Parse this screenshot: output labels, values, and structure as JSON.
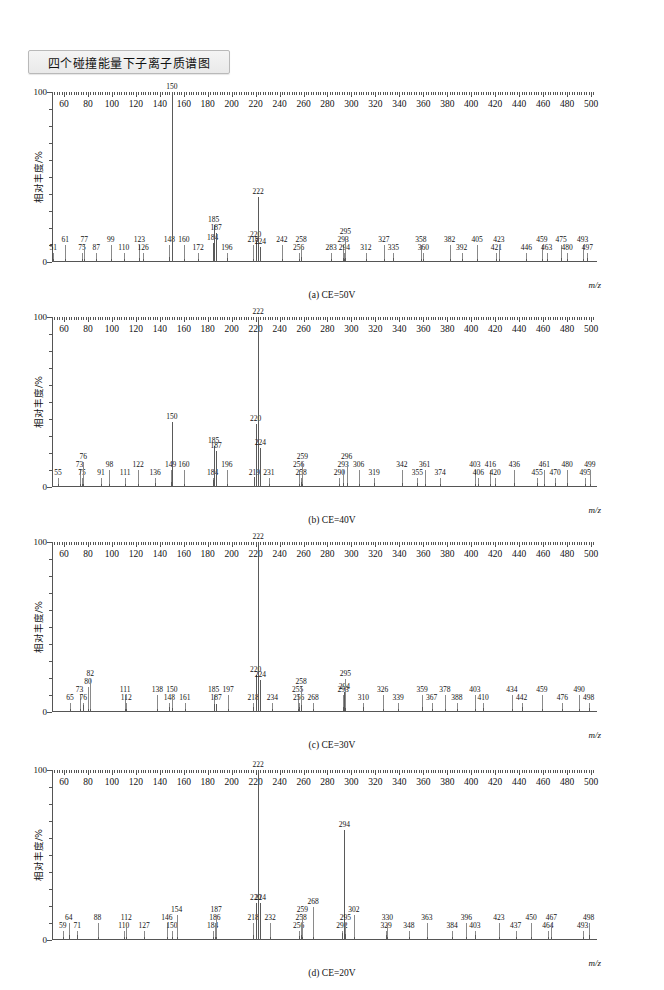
{
  "title": "四个碰撞能量下子离子质谱图",
  "axis": {
    "ylabel": "相对丰度/%",
    "xlabel": "m/z",
    "ytick_labels": [
      "0",
      "100"
    ],
    "xtick_labels": [
      "60",
      "80",
      "100",
      "120",
      "140",
      "160",
      "180",
      "200",
      "220",
      "240",
      "260",
      "280",
      "300",
      "320",
      "340",
      "360",
      "380",
      "400",
      "420",
      "440",
      "460",
      "480",
      "500"
    ],
    "xmin": 50,
    "xmax": 505,
    "ymin": 0,
    "ymax": 100
  },
  "chart_data": [
    {
      "type": "bar",
      "id": "a",
      "title": "(a) CE=50V",
      "xlabel": "m/z",
      "ylabel": "相对丰度/%",
      "xlim": [
        50,
        505
      ],
      "ylim": [
        0,
        100
      ],
      "grid": false,
      "legend": "none",
      "categories": [
        51,
        61,
        75,
        77,
        87,
        99,
        110,
        123,
        126,
        148,
        150,
        160,
        172,
        184,
        185,
        187,
        196,
        218,
        220,
        222,
        224,
        242,
        256,
        258,
        283,
        293,
        294,
        295,
        312,
        327,
        335,
        358,
        360,
        382,
        392,
        405,
        421,
        423,
        446,
        459,
        463,
        475,
        480,
        493,
        497
      ],
      "values": [
        2,
        2,
        2,
        2,
        2,
        2,
        2,
        2.5,
        2,
        3,
        100,
        2,
        2,
        11,
        22,
        17,
        2.5,
        2,
        13,
        38,
        9,
        2,
        2,
        3,
        2,
        2.5,
        2,
        2.5,
        2,
        2,
        2.5,
        2,
        2,
        2,
        2,
        2,
        2,
        2,
        2,
        2,
        2,
        2.5,
        2,
        2,
        2.5
      ]
    },
    {
      "type": "bar",
      "id": "b",
      "title": "(b) CE=40V",
      "xlabel": "m/z",
      "ylabel": "相对丰度/%",
      "xlim": [
        50,
        505
      ],
      "ylim": [
        0,
        100
      ],
      "grid": false,
      "legend": "none",
      "categories": [
        55,
        73,
        75,
        76,
        91,
        98,
        111,
        122,
        136,
        149,
        150,
        160,
        184,
        185,
        187,
        196,
        219,
        220,
        222,
        224,
        231,
        256,
        258,
        259,
        290,
        293,
        296,
        306,
        319,
        342,
        355,
        361,
        374,
        403,
        406,
        416,
        420,
        436,
        455,
        461,
        470,
        480,
        495,
        499
      ],
      "values": [
        2,
        2,
        2,
        2,
        2,
        2,
        2,
        2,
        2.5,
        3,
        38,
        2,
        4,
        24,
        21,
        2,
        6,
        37,
        100,
        23,
        2,
        2,
        3,
        2,
        2,
        2.5,
        2.5,
        2,
        2.5,
        2.5,
        2.5,
        2,
        2,
        2,
        2,
        2,
        2,
        2.5,
        2.5,
        2,
        2.5,
        2.5,
        2,
        2
      ]
    },
    {
      "type": "bar",
      "id": "c",
      "title": "(c) CE=30V",
      "xlabel": "m/z",
      "ylabel": "相对丰度/%",
      "xlim": [
        50,
        505
      ],
      "ylim": [
        0,
        100
      ],
      "grid": false,
      "legend": "none",
      "categories": [
        65,
        73,
        76,
        80,
        82,
        111,
        112,
        138,
        148,
        150,
        161,
        185,
        187,
        197,
        218,
        220,
        222,
        224,
        234,
        255,
        256,
        258,
        268,
        293,
        294,
        295,
        310,
        326,
        339,
        359,
        367,
        378,
        388,
        403,
        410,
        434,
        442,
        459,
        476,
        490,
        498
      ],
      "values": [
        2,
        2,
        4,
        2,
        2,
        2,
        2,
        2,
        3,
        2.5,
        2,
        5,
        4.5,
        2,
        3,
        22,
        100,
        19,
        2,
        2,
        3,
        4,
        2,
        3,
        12,
        2.5,
        3,
        2,
        2,
        3,
        2,
        2,
        2,
        2,
        2.5,
        2,
        3,
        2,
        2,
        2,
        2.5
      ]
    },
    {
      "type": "bar",
      "id": "d",
      "title": "(d) CE=20V",
      "xlabel": "m/z",
      "ylabel": "相对丰度/%",
      "xlim": [
        50,
        505
      ],
      "ylim": [
        0,
        100
      ],
      "grid": false,
      "legend": "none",
      "categories": [
        59,
        64,
        71,
        88,
        110,
        112,
        127,
        146,
        150,
        154,
        184,
        186,
        187,
        218,
        220,
        222,
        224,
        232,
        256,
        258,
        259,
        268,
        292,
        294,
        295,
        302,
        329,
        330,
        348,
        363,
        384,
        396,
        403,
        423,
        437,
        450,
        464,
        467,
        493,
        498
      ],
      "values": [
        2,
        3,
        3,
        2,
        2,
        2,
        2,
        2,
        2,
        2,
        2,
        2,
        2,
        3,
        22,
        100,
        22,
        2,
        2.5,
        3,
        2,
        2,
        4,
        65,
        3.5,
        2,
        3,
        2,
        2,
        2,
        2,
        2,
        3,
        2,
        2,
        2,
        2,
        2,
        2,
        3
      ]
    }
  ],
  "panels": [
    {
      "caption": "(a) CE=50V"
    },
    {
      "caption": "(b) CE=40V"
    },
    {
      "caption": "(c) CE=30V"
    },
    {
      "caption": "(d) CE=20V"
    }
  ]
}
